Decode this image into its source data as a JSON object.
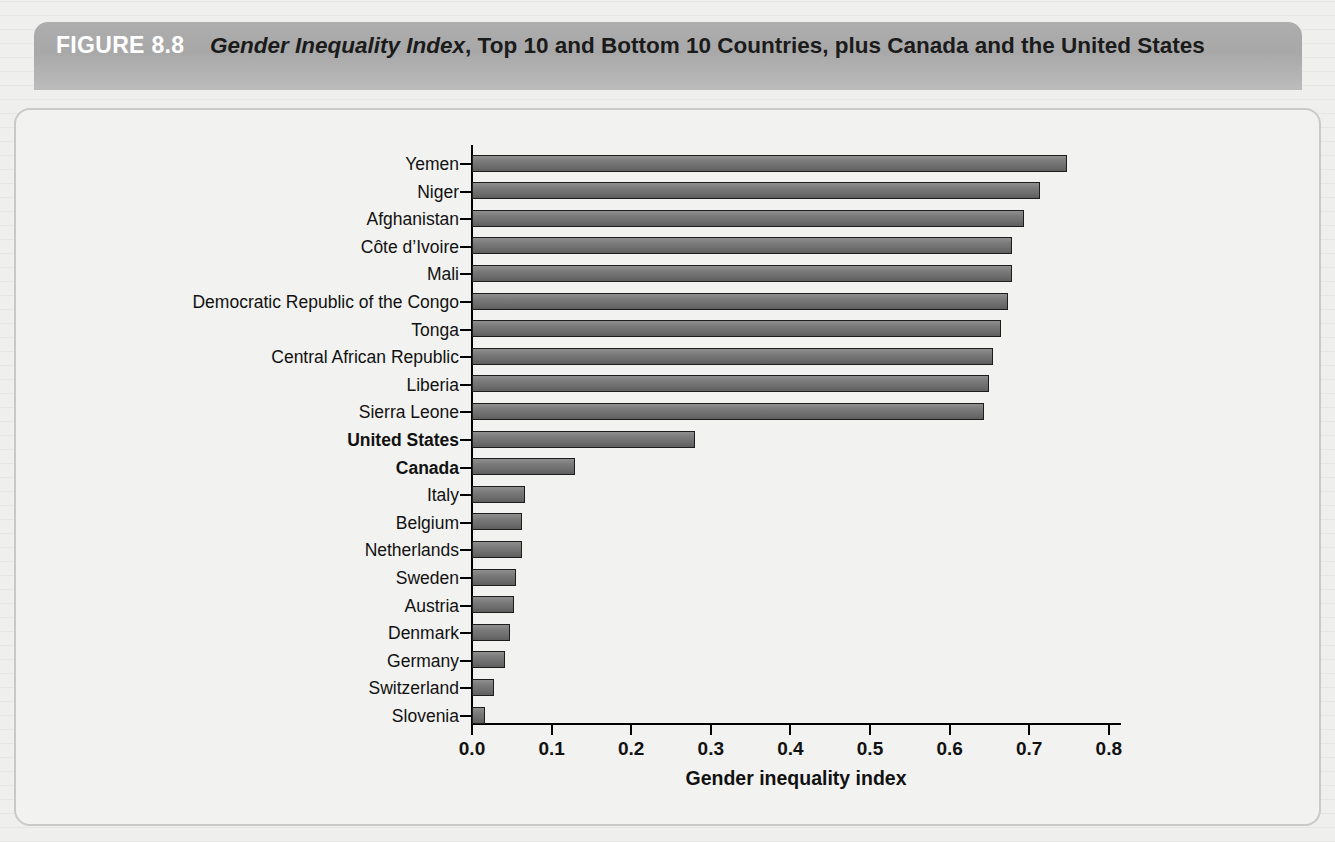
{
  "figure": {
    "number_label": "FIGURE 8.8",
    "title_italic": "Gender Inequality Index",
    "title_rest": ", Top 10 and Bottom 10 Countries, plus Canada and the United States"
  },
  "chart_data": {
    "type": "bar",
    "orientation": "horizontal",
    "title": "Gender Inequality Index, Top 10 and Bottom 10 Countries, plus Canada and the United States",
    "xlabel": "Gender inequality index",
    "ylabel": "",
    "xlim": [
      0.0,
      0.8
    ],
    "xticks": [
      "0.0",
      "0.1",
      "0.2",
      "0.3",
      "0.4",
      "0.5",
      "0.6",
      "0.7",
      "0.8"
    ],
    "xtick_values": [
      0.0,
      0.1,
      0.2,
      0.3,
      0.4,
      0.5,
      0.6,
      0.7,
      0.8
    ],
    "grid": false,
    "legend": "none",
    "bar_color": "#7a7a7a",
    "bar_edge_color": "#1d1d1d",
    "categories": [
      "Yemen",
      "Niger",
      "Afghanistan",
      "Côte d’Ivoire",
      "Mali",
      "Democratic Republic of the Congo",
      "Tonga",
      "Central African Republic",
      "Liberia",
      "Sierra Leone",
      "United States",
      "Canada",
      "Italy",
      "Belgium",
      "Netherlands",
      "Sweden",
      "Austria",
      "Denmark",
      "Germany",
      "Switzerland",
      "Slovenia"
    ],
    "values": [
      0.747,
      0.713,
      0.693,
      0.679,
      0.678,
      0.673,
      0.665,
      0.654,
      0.649,
      0.643,
      0.28,
      0.129,
      0.067,
      0.063,
      0.063,
      0.055,
      0.053,
      0.048,
      0.041,
      0.028,
      0.016
    ],
    "highlighted_categories": [
      "United States",
      "Canada"
    ]
  }
}
